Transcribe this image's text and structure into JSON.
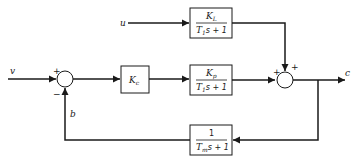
{
  "diagram": {
    "type": "block-diagram",
    "signals": {
      "input": "v",
      "disturbance": "u",
      "output": "c",
      "feedback": "b"
    },
    "blocks": {
      "controller": {
        "label": "K",
        "sub": "c"
      },
      "process": {
        "num": "K",
        "num_sub": "p",
        "den_T": "T",
        "den_T_sub": "1",
        "den_rest": "s + 1"
      },
      "load": {
        "num": "K",
        "num_sub": "L",
        "den_T": "T",
        "den_T_sub": "1",
        "den_rest": "s + 1"
      },
      "measurement": {
        "num": "1",
        "den_T": "T",
        "den_T_sub": "m",
        "den_rest": "s + 1"
      }
    },
    "junctions": {
      "left": {
        "top_sign": "+",
        "bottom_sign": "−"
      },
      "right": {
        "left_sign": "+",
        "top_sign": "+"
      }
    },
    "colors": {
      "line": "#1a1a1a",
      "background": "#ffffff"
    }
  }
}
